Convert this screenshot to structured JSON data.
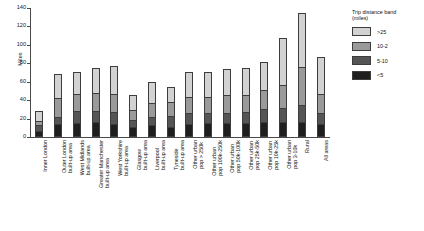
{
  "chart_data": {
    "type": "bar",
    "subtype": "stacked-vertical",
    "title": "",
    "xlabel": "",
    "ylabel": "Miles",
    "ylim": [
      0,
      140
    ],
    "yticks": [
      0,
      20,
      40,
      60,
      80,
      100,
      120,
      140
    ],
    "grid": false,
    "legend": {
      "position": "top-right",
      "title": "Trip distance band\n(miles)",
      "entries": [
        {
          "name": ">25",
          "color": "#d2d2d2"
        },
        {
          "name": "10-2",
          "color": "#9a9a9a"
        },
        {
          "name": "5-10",
          "color": "#555555"
        },
        {
          "name": "<5",
          "color": "#1f1f1f"
        }
      ]
    },
    "categories": [
      "Inner London",
      "Outer London\nbuilt-up area",
      "West Midlands\nbuilt-up area",
      "Greater Manchester\nbuilt-up area",
      "West Yorkshire\nbuilt-up area",
      "Glasgow\nbuilt-up area",
      "Liverpool\nbuilt-up area",
      "Tyneside\nbuilt-up area",
      "Other urban\npop > 250k",
      "Other urban\npop 100k-250k",
      "Other urban\npop 50k-100k",
      "Other urban\npop 25k-50k",
      "Other urban\npop 10k-25k",
      "Other urban\npop 3-10k",
      "Rural",
      "All areas"
    ],
    "series": [
      {
        "name": "<5",
        "color": "#1f1f1f",
        "values": [
          5,
          12,
          13.5,
          14.5,
          12.5,
          9,
          11,
          9.5,
          12.5,
          13,
          13,
          13.5,
          14,
          14.5,
          14,
          12.5
        ]
      },
      {
        "name": "5-10",
        "color": "#555555",
        "values": [
          6.5,
          8,
          13,
          12.5,
          13,
          8,
          9.5,
          11.5,
          12,
          11.5,
          12,
          12,
          14.5,
          15,
          19,
          12.5
        ]
      },
      {
        "name": "10-2",
        "color": "#9a9a9a",
        "values": [
          5.5,
          21,
          19.5,
          19.5,
          20,
          12,
          16,
          16.5,
          18,
          18,
          19.5,
          19.5,
          21.5,
          25.5,
          42,
          21
        ]
      },
      {
        "name": ">25",
        "color": "#d2d2d2",
        "values": [
          11,
          27,
          25,
          28.5,
          31.5,
          17,
          23,
          17,
          28.5,
          28,
          29.5,
          30,
          31,
          53,
          60,
          41
        ]
      }
    ],
    "totals": [
      28,
      68,
      71,
      75,
      77,
      46,
      59.5,
      54.5,
      71,
      70.5,
      74,
      75,
      81,
      108,
      135,
      87
    ]
  },
  "caption": "",
  "colors": {
    "axis": "#4a4a4a",
    "border": "#3d3d3d",
    "background": "#ffffff"
  }
}
